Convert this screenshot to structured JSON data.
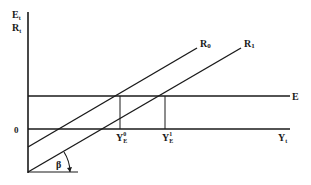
{
  "diagram": {
    "y_axis_label_top": "E",
    "y_axis_label_top_sub": "t",
    "y_axis_label_bottom": "R",
    "y_axis_label_bottom_sub": "t",
    "x_axis_label": "Y",
    "x_axis_label_sub": "t",
    "origin_label": "0",
    "line_r0_label": "R",
    "line_r0_sub": "0",
    "line_r1_label": "R",
    "line_r1_sub": "1",
    "line_e_label": "E",
    "ye0_label": "Y",
    "ye0_sub": "E",
    "ye0_sup": "0",
    "ye1_label": "Y",
    "ye1_sub": "E",
    "ye1_sup": "1",
    "angle_label": "β",
    "line_color": "#1a1a1a"
  }
}
